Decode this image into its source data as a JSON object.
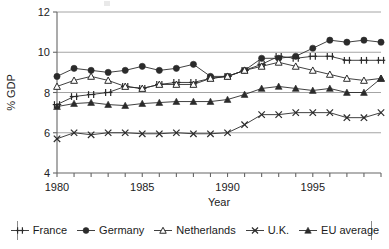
{
  "figure": {
    "background": "#ffffff",
    "line_color": "#2b2b2b",
    "grid_color": "#9a9a9a",
    "axis_color": "#666666"
  },
  "axes": {
    "y_title": "% GDP",
    "x_title": "Year",
    "y_ticks": [
      "4",
      "6",
      "8",
      "10",
      "12"
    ],
    "y_tick_values": [
      4,
      6,
      8,
      10,
      12
    ],
    "x_ticks_labeled": [
      "1980",
      "1985",
      "1990",
      "1995"
    ],
    "x_tick_values_labeled": [
      1980,
      1985,
      1990,
      1995
    ],
    "ylim": [
      4,
      12
    ],
    "xlim": [
      1980,
      1999
    ],
    "grid": "horizontal"
  },
  "legend": {
    "position": "bottom",
    "entries": [
      {
        "label": "France",
        "marker": "plus-marker"
      },
      {
        "label": "Germany",
        "marker": "filled-circle-marker"
      },
      {
        "label": "Netherlands",
        "marker": "open-triangle-marker"
      },
      {
        "label": "U.K.",
        "marker": "x-marker"
      },
      {
        "label": "EU average",
        "marker": "filled-triangle-marker"
      }
    ]
  },
  "source_note": "",
  "chart_data": {
    "type": "line",
    "title": "",
    "subtitle": "",
    "xlabel": "Year",
    "ylabel": "% GDP",
    "xlim": [
      1980,
      1999
    ],
    "ylim": [
      4,
      12
    ],
    "grid": true,
    "legend_position": "bottom",
    "x": [
      1980,
      1981,
      1982,
      1983,
      1984,
      1985,
      1986,
      1987,
      1988,
      1989,
      1990,
      1991,
      1992,
      1993,
      1994,
      1995,
      1996,
      1997,
      1998,
      1999
    ],
    "series": [
      {
        "name": "France",
        "marker": "plus-marker",
        "values": [
          7.4,
          7.8,
          7.9,
          8.0,
          8.3,
          8.2,
          8.4,
          8.5,
          8.5,
          8.7,
          8.8,
          9.1,
          9.4,
          9.8,
          9.7,
          9.8,
          9.8,
          9.6,
          9.6,
          9.6
        ]
      },
      {
        "name": "Germany",
        "marker": "filled-circle-marker",
        "values": [
          8.8,
          9.2,
          9.1,
          9.0,
          9.1,
          9.3,
          9.1,
          9.2,
          9.4,
          8.8,
          8.8,
          9.1,
          9.7,
          9.7,
          9.8,
          10.2,
          10.6,
          10.5,
          10.6,
          10.5
        ]
      },
      {
        "name": "Netherlands",
        "marker": "open-triangle-marker",
        "values": [
          8.3,
          8.6,
          8.8,
          8.6,
          8.3,
          8.2,
          8.4,
          8.4,
          8.4,
          8.7,
          8.8,
          9.1,
          9.3,
          9.5,
          9.3,
          9.1,
          8.9,
          8.7,
          8.6,
          8.7
        ]
      },
      {
        "name": "U.K.",
        "marker": "x-marker",
        "values": [
          5.7,
          6.0,
          5.9,
          6.0,
          6.0,
          5.95,
          5.95,
          6.0,
          5.95,
          5.95,
          6.0,
          6.4,
          6.9,
          6.9,
          7.0,
          7.0,
          7.0,
          6.75,
          6.75,
          7.0
        ]
      },
      {
        "name": "EU average",
        "marker": "filled-triangle-marker",
        "values": [
          7.3,
          7.45,
          7.5,
          7.4,
          7.35,
          7.45,
          7.5,
          7.55,
          7.55,
          7.55,
          7.65,
          7.9,
          8.2,
          8.3,
          8.2,
          8.1,
          8.2,
          8.0,
          8.0,
          8.7
        ]
      }
    ]
  }
}
